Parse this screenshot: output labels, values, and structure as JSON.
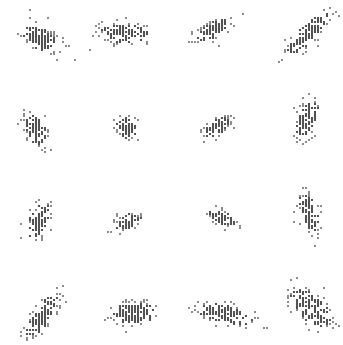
{
  "chart_data": {
    "type": "scatter",
    "title": "",
    "xlabel": "",
    "ylabel": "",
    "grid": false,
    "legend": null,
    "layout": {
      "rows": 4,
      "cols": 4,
      "width": 343,
      "height": 345
    },
    "dot_color": "#1a1a1a",
    "background": "#ffffff",
    "panels": [
      {
        "row": 0,
        "col": 0,
        "cx": 40,
        "cy": 38,
        "sx": 11,
        "sy": 6,
        "angle": -35,
        "n": 90
      },
      {
        "row": 0,
        "col": 1,
        "cx": 124,
        "cy": 33,
        "sx": 13,
        "sy": 5,
        "angle": 0,
        "n": 85
      },
      {
        "row": 0,
        "col": 2,
        "cx": 213,
        "cy": 30,
        "sx": 11,
        "sy": 4,
        "angle": 30,
        "n": 70
      },
      {
        "row": 0,
        "col": 3,
        "cx": 308,
        "cy": 34,
        "sx": 16,
        "sy": 5,
        "angle": 45,
        "n": 95
      },
      {
        "row": 1,
        "col": 0,
        "cx": 36,
        "cy": 130,
        "sx": 9,
        "sy": 5,
        "angle": -65,
        "n": 60
      },
      {
        "row": 1,
        "col": 1,
        "cx": 127,
        "cy": 128,
        "sx": 6,
        "sy": 5,
        "angle": -60,
        "n": 45
      },
      {
        "row": 1,
        "col": 2,
        "cx": 217,
        "cy": 127,
        "sx": 8,
        "sy": 4,
        "angle": 35,
        "n": 50
      },
      {
        "row": 1,
        "col": 3,
        "cx": 307,
        "cy": 120,
        "sx": 11,
        "sy": 5,
        "angle": 75,
        "n": 70
      },
      {
        "row": 2,
        "col": 0,
        "cx": 39,
        "cy": 222,
        "sx": 11,
        "sy": 5,
        "angle": 70,
        "n": 60
      },
      {
        "row": 2,
        "col": 1,
        "cx": 128,
        "cy": 222,
        "sx": 7,
        "sy": 4,
        "angle": 15,
        "n": 40
      },
      {
        "row": 2,
        "col": 2,
        "cx": 222,
        "cy": 218,
        "sx": 8,
        "sy": 4,
        "angle": -25,
        "n": 45
      },
      {
        "row": 2,
        "col": 3,
        "cx": 309,
        "cy": 214,
        "sx": 11,
        "sy": 5,
        "angle": -75,
        "n": 60
      },
      {
        "row": 3,
        "col": 0,
        "cx": 42,
        "cy": 316,
        "sx": 14,
        "sy": 5,
        "angle": 55,
        "n": 80
      },
      {
        "row": 3,
        "col": 1,
        "cx": 134,
        "cy": 313,
        "sx": 12,
        "sy": 6,
        "angle": 5,
        "n": 90
      },
      {
        "row": 3,
        "col": 2,
        "cx": 226,
        "cy": 314,
        "sx": 15,
        "sy": 5,
        "angle": -12,
        "n": 85
      },
      {
        "row": 3,
        "col": 3,
        "cx": 311,
        "cy": 308,
        "sx": 13,
        "sy": 7,
        "angle": -45,
        "n": 95
      }
    ],
    "grid_step": 3,
    "dot_radius": 1.1,
    "seed": 7
  }
}
